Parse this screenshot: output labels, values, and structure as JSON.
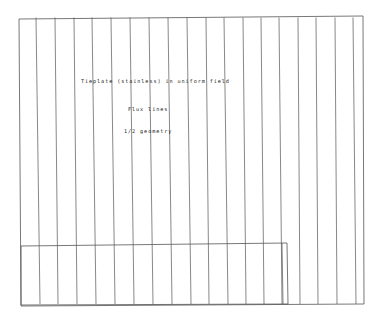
{
  "figure": {
    "title": "Tieplate (stainless) in uniform field",
    "subtitle": "Flux lines",
    "note": "1/2 geometry",
    "line_color": "#555555",
    "background": "#ffffff"
  },
  "frame": {
    "x1": 19,
    "y1": 18,
    "x2": 363,
    "y2": 304
  },
  "tieplate_rect": {
    "x1": 21,
    "y1": 245,
    "x2": 287,
    "y2": 304
  },
  "flux_lines": [
    {
      "top_x": 36,
      "bottom_x": 40
    },
    {
      "top_x": 55,
      "bottom_x": 58
    },
    {
      "top_x": 74,
      "bottom_x": 77
    },
    {
      "top_x": 92,
      "bottom_x": 96
    },
    {
      "top_x": 111,
      "bottom_x": 115
    },
    {
      "top_x": 130,
      "bottom_x": 134
    },
    {
      "top_x": 149,
      "bottom_x": 153
    },
    {
      "top_x": 168,
      "bottom_x": 172
    },
    {
      "top_x": 187,
      "bottom_x": 191
    },
    {
      "top_x": 206,
      "bottom_x": 209
    },
    {
      "top_x": 224,
      "bottom_x": 228
    },
    {
      "top_x": 243,
      "bottom_x": 246
    },
    {
      "top_x": 261,
      "bottom_x": 264
    },
    {
      "top_x": 279,
      "bottom_x": 282
    },
    {
      "top_x": 298,
      "bottom_x": 300
    },
    {
      "top_x": 316,
      "bottom_x": 318
    },
    {
      "top_x": 335,
      "bottom_x": 337
    },
    {
      "top_x": 353,
      "bottom_x": 356
    }
  ]
}
